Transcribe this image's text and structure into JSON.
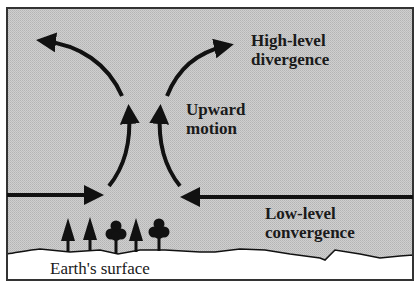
{
  "diagram": {
    "labels": {
      "high_level_line1": "High-level",
      "high_level_line2": "divergence",
      "upward_line1": "Upward",
      "upward_line2": "motion",
      "low_level_line1": "Low-level",
      "low_level_line2": "convergence",
      "surface": "Earth's surface"
    },
    "colors": {
      "atmosphere_fill": "#c6c6c6",
      "ground_fill": "#ffffff",
      "ink": "#111111",
      "frame": "#333333"
    },
    "icons": {
      "trees": [
        "conifer-tree",
        "conifer-tree",
        "deciduous-tree",
        "conifer-tree",
        "deciduous-tree"
      ],
      "arrows": [
        "convergence-arrow-left",
        "convergence-arrow-right",
        "updraft-arrow-left",
        "updraft-arrow-right",
        "divergence-arrow-left",
        "divergence-arrow-right"
      ]
    }
  }
}
